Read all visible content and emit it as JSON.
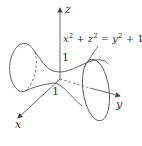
{
  "figure": {
    "type": "hyperboloid-of-one-sheet",
    "equation": {
      "lhs_x": "x",
      "lhs_x_exp": "2",
      "plus1": " + ",
      "lhs_z": "z",
      "lhs_z_exp": "2",
      "equals": " = ",
      "rhs_y": "y",
      "rhs_y_exp": "2",
      "rhs_const": " + 1"
    },
    "axes": {
      "x_label": "x",
      "y_label": "y",
      "z_label": "z"
    },
    "ticks": {
      "z_one": "1",
      "x_one": "1"
    },
    "colors": {
      "stroke": "#555555",
      "background": "#ffffff"
    }
  }
}
